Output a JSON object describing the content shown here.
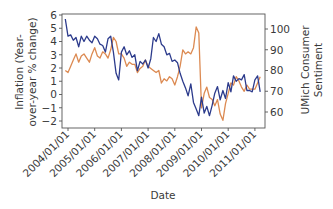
{
  "chart_data": {
    "type": "line",
    "title": "",
    "xlabel": "Date",
    "ylabel": "Inflation (Year-over-year % change)",
    "ylabel_left_lines": [
      "Inflation (Year-",
      "over-year % change)"
    ],
    "y2label": "UMich Consumer Sentiment",
    "y2label_lines": [
      "UMich Consumer",
      "Sentiment"
    ],
    "x_ticks": [
      "2004/01/01",
      "2005/01/01",
      "2006/01/01",
      "2007/01/01",
      "2008/01/01",
      "2009/01/01",
      "2010/01/01",
      "2011/01/01"
    ],
    "ylim": [
      -2,
      6
    ],
    "y_ticks": [
      -2,
      -1,
      0,
      1,
      2,
      3,
      4,
      5,
      6
    ],
    "y2lim": [
      55,
      105
    ],
    "y2_ticks": [
      60,
      70,
      80,
      90,
      100
    ],
    "grid": false,
    "legend": "none",
    "colors": {
      "inflation": "#2c3b8c",
      "sentiment": "#dc8a52",
      "axis": "#555555",
      "text": "#3a3a3a"
    },
    "series": [
      {
        "name": "Inflation",
        "axis": "left",
        "x": [
          2003.9,
          2004.0,
          2004.1,
          2004.2,
          2004.3,
          2004.4,
          2004.5,
          2004.6,
          2004.7,
          2004.8,
          2004.9,
          2005.0,
          2005.1,
          2005.2,
          2005.3,
          2005.4,
          2005.5,
          2005.6,
          2005.7,
          2005.8,
          2005.9,
          2006.0,
          2006.1,
          2006.2,
          2006.3,
          2006.4,
          2006.5,
          2006.6,
          2006.7,
          2006.8,
          2006.9,
          2007.0,
          2007.1,
          2007.2,
          2007.3,
          2007.4,
          2007.5,
          2007.6,
          2007.7,
          2007.8,
          2007.9,
          2008.0,
          2008.1,
          2008.2,
          2008.3,
          2008.4,
          2008.5,
          2008.6,
          2008.7,
          2008.8,
          2008.9,
          2009.0,
          2009.1,
          2009.2,
          2009.3,
          2009.4,
          2009.5,
          2009.6,
          2009.7,
          2009.8,
          2009.9,
          2010.0,
          2010.1,
          2010.2,
          2010.3,
          2010.4,
          2010.5,
          2010.6,
          2010.7,
          2010.8,
          2010.9,
          2011.0,
          2011.1,
          2011.2
        ],
        "values": [
          5.7,
          4.4,
          4.5,
          4.1,
          4.3,
          3.6,
          4.4,
          4.0,
          4.4,
          4.1,
          3.9,
          4.4,
          4.2,
          3.8,
          3.7,
          3.2,
          4.2,
          4.4,
          3.2,
          1.6,
          1.1,
          3.2,
          3.6,
          3.0,
          3.3,
          2.8,
          3.0,
          1.8,
          2.5,
          2.3,
          2.6,
          2.0,
          2.7,
          4.3,
          4.0,
          4.6,
          3.8,
          3.6,
          3.0,
          3.1,
          2.5,
          2.6,
          2.4,
          1.6,
          1.0,
          0.5,
          -0.1,
          0.8,
          -0.6,
          -1.1,
          -1.6,
          -0.2,
          -1.4,
          -0.9,
          -1.6,
          -0.8,
          0.1,
          0.6,
          -0.4,
          0.3,
          -0.3,
          0.9,
          0.2,
          1.4,
          1.0,
          1.2,
          1.1,
          1.5,
          0.3,
          0.3,
          0.2,
          1.1,
          1.4,
          0.2
        ],
        "note": "values approximate, read from the plot"
      },
      {
        "name": "UMich Consumer Sentiment",
        "axis": "right",
        "x": [
          2003.9,
          2004.0,
          2004.1,
          2004.2,
          2004.3,
          2004.4,
          2004.5,
          2004.6,
          2004.7,
          2004.8,
          2004.9,
          2005.0,
          2005.1,
          2005.2,
          2005.3,
          2005.4,
          2005.5,
          2005.6,
          2005.7,
          2005.8,
          2005.9,
          2006.0,
          2006.1,
          2006.2,
          2006.3,
          2006.4,
          2006.5,
          2006.6,
          2006.7,
          2006.8,
          2006.9,
          2007.0,
          2007.1,
          2007.2,
          2007.3,
          2007.4,
          2007.5,
          2007.6,
          2007.7,
          2007.8,
          2007.9,
          2008.0,
          2008.1,
          2008.2,
          2008.3,
          2008.4,
          2008.5,
          2008.6,
          2008.7,
          2008.8,
          2008.9,
          2009.0,
          2009.1,
          2009.2,
          2009.3,
          2009.4,
          2009.5,
          2009.6,
          2009.7,
          2009.8,
          2009.9,
          2010.0,
          2010.1,
          2010.2,
          2010.3,
          2010.4,
          2010.5,
          2010.6,
          2010.7,
          2010.8,
          2010.9,
          2011.0,
          2011.1,
          2011.2
        ],
        "values": [
          80,
          79,
          82,
          85,
          88,
          84,
          87,
          88,
          86,
          84,
          88,
          91,
          87,
          86,
          89,
          88,
          86,
          90,
          96,
          94,
          88,
          88,
          86,
          82,
          84,
          83,
          83,
          79,
          81,
          82,
          85,
          82,
          81,
          80,
          79,
          80,
          74,
          76,
          75,
          77,
          76,
          73,
          77,
          82,
          90,
          88,
          89,
          88,
          91,
          101,
          98,
          62,
          69,
          72,
          67,
          66,
          63,
          66,
          59,
          56,
          64,
          69,
          74,
          73,
          77,
          75,
          72,
          70,
          73,
          71,
          71,
          71,
          74,
          77
        ],
        "note": "values approximate, read from the plot"
      }
    ]
  }
}
